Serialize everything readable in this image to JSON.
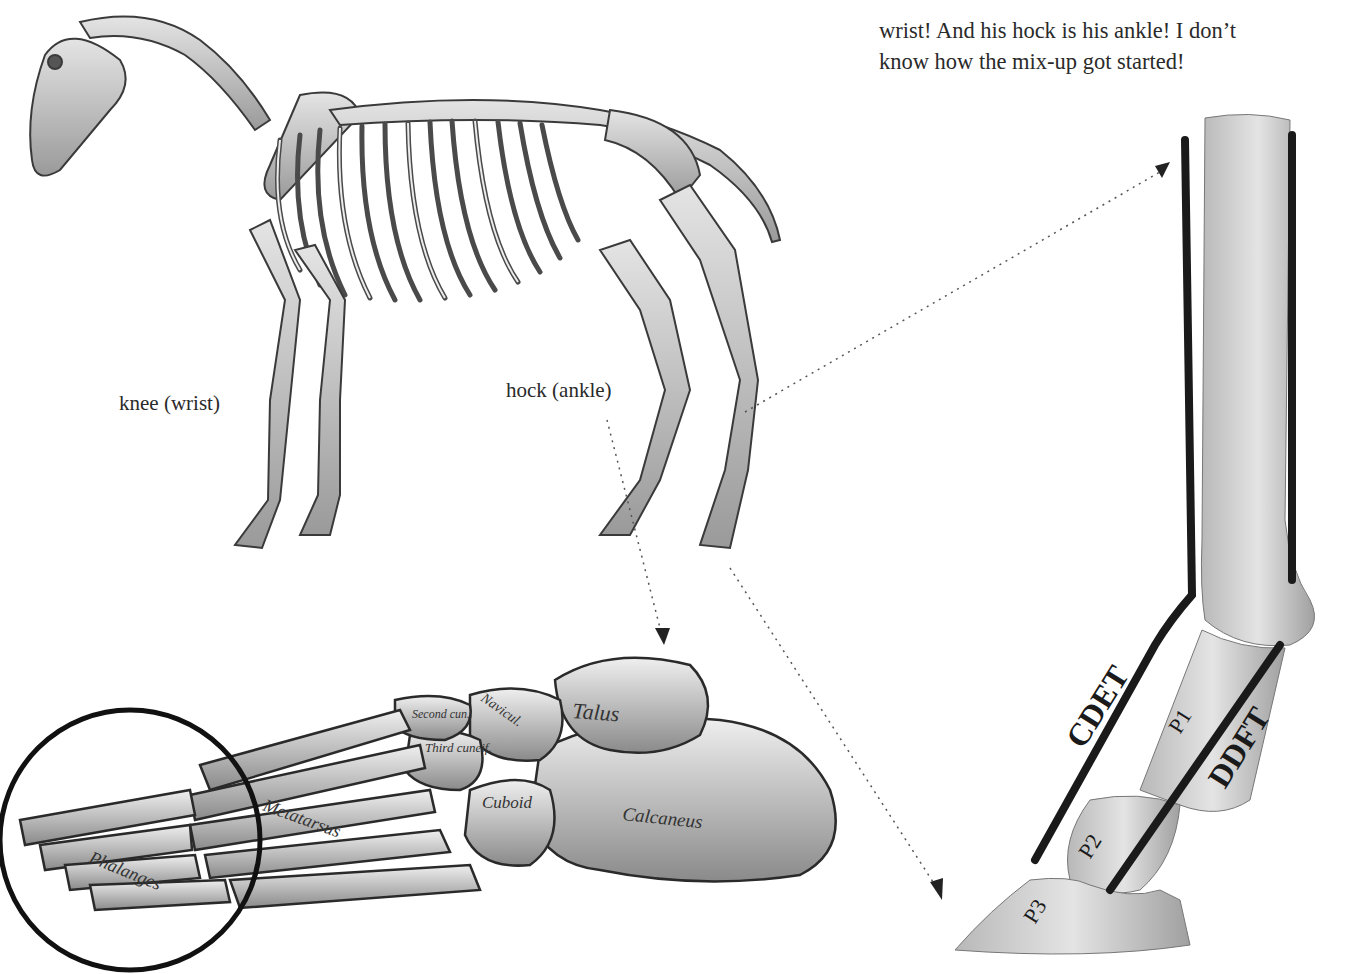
{
  "caption": {
    "lines": [
      "… is really his",
      "wrist!  And his hock is his ankle! I don’t",
      "know how the mix-up got started!"
    ]
  },
  "horse_skeleton": {
    "labels": {
      "knee": "knee (wrist)",
      "hock": "hock (ankle)"
    }
  },
  "foot_diagram": {
    "labels": {
      "talus": "Talus",
      "calcaneus": "Calcaneus",
      "cuboid": "Cuboid",
      "third_cuneiform": "Third cuneif.",
      "second_cuneiform": "Second cun.",
      "navicular": "Navicul.",
      "metatarsus": "Metatarsus",
      "phalanges": "Phalanges"
    }
  },
  "leg_diagram": {
    "labels": {
      "cdet": "CDET",
      "ddft": "DDFT",
      "p1": "P1",
      "p2": "P2",
      "p3": "P3"
    }
  },
  "colors": {
    "background": "#ffffff",
    "text": "#2a2a2a",
    "bone_light": "#d9d9d9",
    "bone_mid": "#a8a8a8",
    "outline": "#1a1a1a"
  }
}
